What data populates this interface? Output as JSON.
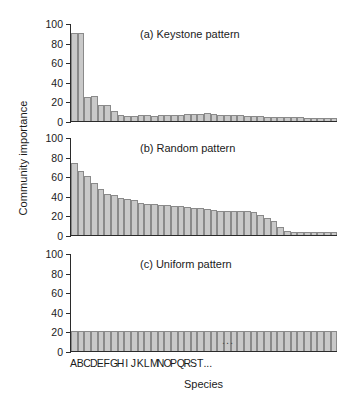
{
  "figure": {
    "ylabel": "Community importance",
    "xlabel": "Species",
    "xtick_labels": [
      "A",
      "B",
      "C",
      "D",
      "E",
      "F",
      "G",
      "H",
      "I",
      "J",
      "K",
      "L",
      "M",
      "N",
      "O",
      "P",
      "Q",
      "R",
      "S",
      "T",
      "..."
    ],
    "ytick_labels": [
      "100",
      "80",
      "60",
      "40",
      "20",
      "0"
    ],
    "bar_fill": "#c9c9c9",
    "bar_stroke": "#8a8a8a",
    "axis_color": "#2b2b2b",
    "inbar_ellipsis": "..."
  },
  "chart_data": [
    {
      "type": "bar",
      "title": "(a) Keystone pattern",
      "xlabel": "Species",
      "ylabel": "Community importance",
      "ylim": [
        0,
        100
      ],
      "yticks": [
        0,
        20,
        40,
        60,
        80,
        100
      ],
      "grid": false,
      "legend": "none",
      "categories": [
        "A",
        "B",
        "C",
        "D",
        "E",
        "F",
        "G",
        "H",
        "I",
        "J",
        "K",
        "L",
        "M",
        "N",
        "O",
        "P",
        "Q",
        "R",
        "S",
        "T",
        "U",
        "V",
        "W",
        "X",
        "Y",
        "Z",
        "AA",
        "AB",
        "AC",
        "AD",
        "AE",
        "AF",
        "AG",
        "AH",
        "AI",
        "AJ",
        "AK",
        "AL",
        "AM",
        "AN"
      ],
      "values": [
        90,
        90,
        25,
        26,
        16,
        16,
        10,
        6,
        5,
        5,
        6,
        6,
        5,
        6,
        6,
        6,
        6,
        7,
        7,
        7,
        8,
        7,
        6,
        6,
        6,
        6,
        5,
        5,
        5,
        4,
        4,
        4,
        4,
        4,
        4,
        3,
        3,
        3,
        3,
        3
      ]
    },
    {
      "type": "bar",
      "title": "(b) Random pattern",
      "xlabel": "Species",
      "ylabel": "Community importance",
      "ylim": [
        0,
        100
      ],
      "yticks": [
        0,
        20,
        40,
        60,
        80,
        100
      ],
      "grid": false,
      "legend": "none",
      "categories": [
        "A",
        "B",
        "C",
        "D",
        "E",
        "F",
        "G",
        "H",
        "I",
        "J",
        "K",
        "L",
        "M",
        "N",
        "O",
        "P",
        "Q",
        "R",
        "S",
        "T",
        "U",
        "V",
        "W",
        "X",
        "Y",
        "Z",
        "AA",
        "AB",
        "AC",
        "AD",
        "AE",
        "AF",
        "AG",
        "AH",
        "AI",
        "AJ",
        "AK",
        "AL",
        "AM",
        "AN"
      ],
      "values": [
        73,
        65,
        60,
        53,
        47,
        42,
        41,
        38,
        37,
        36,
        33,
        32,
        32,
        31,
        31,
        30,
        30,
        29,
        28,
        28,
        27,
        26,
        25,
        25,
        25,
        24,
        24,
        23,
        20,
        17,
        14,
        8,
        4,
        3,
        3,
        3,
        3,
        3,
        3,
        3
      ]
    },
    {
      "type": "bar",
      "title": "(c) Uniform pattern",
      "xlabel": "Species",
      "ylabel": "Community importance",
      "ylim": [
        0,
        100
      ],
      "yticks": [
        0,
        20,
        40,
        60,
        80,
        100
      ],
      "grid": false,
      "legend": "none",
      "categories": [
        "A",
        "B",
        "C",
        "D",
        "E",
        "F",
        "G",
        "H",
        "I",
        "J",
        "K",
        "L",
        "M",
        "N",
        "O",
        "P",
        "Q",
        "R",
        "S",
        "T",
        "U",
        "V",
        "W",
        "X",
        "Y",
        "Z",
        "AA",
        "AB",
        "AC",
        "AD",
        "AE",
        "AF",
        "AG",
        "AH",
        "AI",
        "AJ",
        "AK",
        "AL",
        "AM",
        "AN"
      ],
      "values": [
        20,
        20,
        20,
        20,
        20,
        20,
        20,
        20,
        20,
        20,
        20,
        20,
        20,
        20,
        20,
        20,
        20,
        20,
        20,
        20,
        20,
        20,
        20,
        20,
        20,
        20,
        20,
        20,
        20,
        20,
        20,
        20,
        20,
        20,
        20,
        20,
        20,
        20,
        20,
        20
      ]
    }
  ]
}
